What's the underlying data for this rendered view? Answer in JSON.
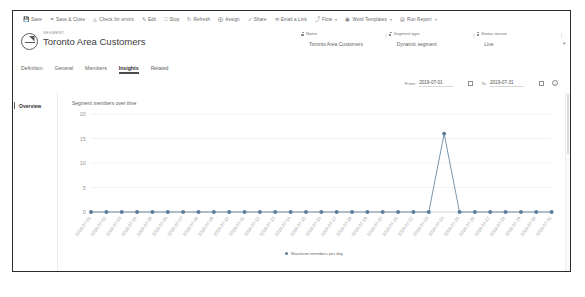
{
  "command_bar": {
    "items": [
      {
        "label": "Save",
        "icon": "save-icon",
        "glyph": "ὋE",
        "caret": false
      },
      {
        "label": "Save & Close",
        "icon": "save-and-close-icon",
        "glyph": "⤓",
        "caret": false
      },
      {
        "label": "Check for errors",
        "icon": "check-errors-icon",
        "glyph": "◴",
        "caret": false
      },
      {
        "label": "Edit",
        "icon": "edit-icon",
        "glyph": "✎",
        "caret": false
      },
      {
        "label": "Stop",
        "icon": "stop-icon",
        "glyph": "□",
        "caret": false
      },
      {
        "label": "Refresh",
        "icon": "refresh-icon",
        "glyph": "↻",
        "caret": false
      },
      {
        "label": "Assign",
        "icon": "assign-person-icon",
        "glyph": "⨁",
        "caret": false
      },
      {
        "label": "Share",
        "icon": "share-icon",
        "glyph": "➦",
        "caret": false
      },
      {
        "label": "Email a Link",
        "icon": "email-link-icon",
        "glyph": "✉",
        "caret": false
      },
      {
        "label": "Flow",
        "icon": "flow-icon",
        "glyph": "⤴",
        "caret": true
      },
      {
        "label": "Word Templates",
        "icon": "word-template-icon",
        "glyph": "▣",
        "caret": true
      },
      {
        "label": "Run Report",
        "icon": "run-report-icon",
        "glyph": "▤",
        "caret": true
      }
    ]
  },
  "record_header": {
    "entity_label": "SEGMENT",
    "title": "Toronto Area Customers",
    "entity_icon": "segment-pie-icon",
    "fields": [
      {
        "label": "Name",
        "value": "Toronto Area Customers",
        "lock_icon": "lock-icon"
      },
      {
        "label": "Segment type",
        "value": "Dynamic segment",
        "lock_icon": "lock-icon"
      },
      {
        "label": "Status reason",
        "value": "Live",
        "lock_icon": "lock-icon"
      }
    ]
  },
  "tabs": [
    {
      "label": "Definition",
      "active": false
    },
    {
      "label": "General",
      "active": false
    },
    {
      "label": "Members",
      "active": false
    },
    {
      "label": "Insights",
      "active": true
    },
    {
      "label": "Related",
      "active": false
    }
  ],
  "date_range": {
    "from_label": "From:",
    "from_value": "2019-07-01",
    "to_label": "To:",
    "to_value": "2019-07-31",
    "calendar_icon": "calendar-icon",
    "info_icon": "info-icon"
  },
  "left_nav": {
    "items": [
      {
        "label": "Overview",
        "selected": true
      }
    ]
  },
  "chart_data": {
    "type": "line",
    "title": "Segment members over time",
    "xlabel": "",
    "ylabel": "",
    "ylim": [
      0,
      20
    ],
    "yticks": [
      0,
      5,
      10,
      15,
      20
    ],
    "ytick_labels": [
      "0",
      "5",
      "10",
      "15",
      "20"
    ],
    "grid": true,
    "legend_position": "bottom",
    "series": [
      {
        "name": "Maximum members per day",
        "color": "#5b7d9a",
        "values": [
          0,
          0,
          0,
          0,
          0,
          0,
          0,
          0,
          0,
          0,
          0,
          0,
          0,
          0,
          0,
          0,
          0,
          0,
          0,
          0,
          0,
          0,
          0,
          16,
          0,
          0,
          0,
          0,
          0,
          0,
          0
        ]
      }
    ],
    "categories": [
      "2019-07-01",
      "2019-07-02",
      "2019-07-03",
      "2019-07-04",
      "2019-07-05",
      "2019-07-06",
      "2019-07-07",
      "2019-07-08",
      "2019-07-09",
      "2019-07-10",
      "2019-07-11",
      "2019-07-12",
      "2019-07-13",
      "2019-07-14",
      "2019-07-15",
      "2019-07-16",
      "2019-07-17",
      "2019-07-18",
      "2019-07-19",
      "2019-07-20",
      "2019-07-21",
      "2019-07-22",
      "2019-07-23",
      "2019-07-24",
      "2019-07-25",
      "2019-07-26",
      "2019-07-27",
      "2019-07-28",
      "2019-07-29",
      "2019-07-30",
      "2019-07-31"
    ]
  }
}
